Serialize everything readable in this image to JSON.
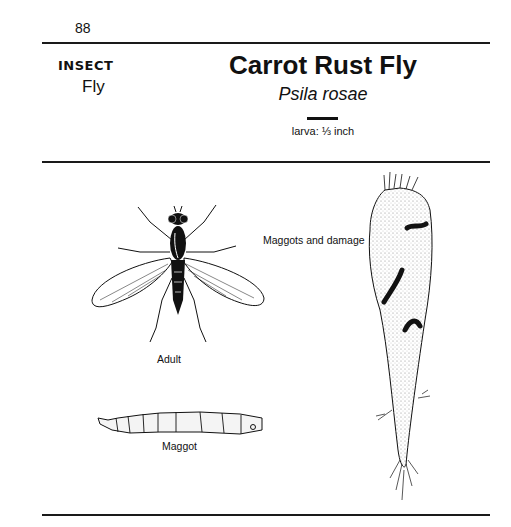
{
  "page": {
    "number": "88",
    "category": "INSECT",
    "subcategory": "Fly",
    "title": "Carrot Rust Fly",
    "scientific_name": "Psila rosae",
    "scale_label": "larva: ⅓ inch"
  },
  "figures": [
    {
      "id": "adult",
      "caption": "Adult",
      "icon": "adult-fly-illustration"
    },
    {
      "id": "maggot",
      "caption": "Maggot",
      "icon": "maggot-larva-illustration"
    },
    {
      "id": "carrot",
      "caption": "Maggots and damage",
      "icon": "damaged-carrot-illustration"
    }
  ],
  "colors": {
    "ink": "#111111",
    "paper": "#ffffff",
    "stipple": "#dddddd"
  }
}
